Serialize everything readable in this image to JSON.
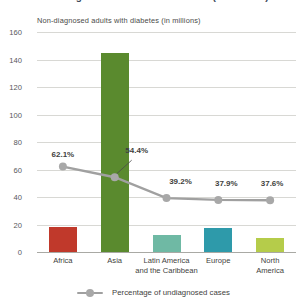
{
  "title_sliver": "Non-diagnosed adults with diabetes (in millions)",
  "axis_subtitle": "Non-diagnosed adults with diabetes (in millions)",
  "legend": {
    "marker_icon": "line-marker-icon",
    "label": "Percentage of undiagnosed cases"
  },
  "colors": {
    "africa": "#c0392b",
    "asia": "#5a8a2e",
    "latin_america": "#6fb9a4",
    "europe": "#2e9aaa",
    "north_america": "#b5cc4a",
    "line": "#a0a0a0",
    "marker": "#a8a8a8",
    "gridline": "#d8d8d4",
    "baseline": "#a9a9a4",
    "text": "#3f3f40"
  },
  "chart_data": {
    "type": "bar",
    "title": "Non-diagnosed adults with diabetes (in millions)",
    "xlabel": "",
    "ylabel": "Non-diagnosed adults with diabetes (in millions)",
    "ylim": [
      0,
      160
    ],
    "yticks": [
      0,
      20,
      40,
      60,
      80,
      100,
      120,
      140,
      160
    ],
    "ytick_labels": [
      "0",
      "20",
      "40",
      "60",
      "80",
      "100",
      "120",
      "140",
      "160"
    ],
    "grid": true,
    "legend_position": "bottom",
    "categories": [
      "Africa",
      "Asia",
      "Latin America\nand the Caribbean",
      "Europe",
      "North\nAmerica"
    ],
    "series": [
      {
        "name": "Non-diagnosed adults with diabetes (in millions)",
        "type": "bar",
        "values": [
          18,
          145,
          12.5,
          17.5,
          10
        ],
        "colors": [
          "#c0392b",
          "#5a8a2e",
          "#6fb9a4",
          "#2e9aaa",
          "#b5cc4a"
        ]
      },
      {
        "name": "Percentage of undiagnosed cases",
        "type": "line",
        "values": [
          62.1,
          54.4,
          39.2,
          37.9,
          37.6
        ],
        "labels": [
          "62.1%",
          "54.4%",
          "39.2%",
          "37.9%",
          "37.6%"
        ],
        "color": "#a0a0a0"
      }
    ]
  }
}
